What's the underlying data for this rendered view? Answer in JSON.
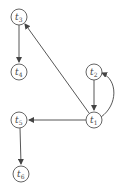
{
  "diagram": {
    "type": "directed-graph",
    "nodes": [
      {
        "id": "t1",
        "label": "t",
        "sub": "1",
        "x": 94,
        "y": 120
      },
      {
        "id": "t2",
        "label": "t",
        "sub": "2",
        "x": 94,
        "y": 72
      },
      {
        "id": "t3",
        "label": "t",
        "sub": "3",
        "x": 19,
        "y": 17
      },
      {
        "id": "t4",
        "label": "t",
        "sub": "4",
        "x": 19,
        "y": 72
      },
      {
        "id": "t5",
        "label": "t",
        "sub": "5",
        "x": 19,
        "y": 120
      },
      {
        "id": "t6",
        "label": "t",
        "sub": "6",
        "x": 21,
        "y": 174
      }
    ],
    "edges": [
      {
        "from": "t3",
        "to": "t4"
      },
      {
        "from": "t1",
        "to": "t3"
      },
      {
        "from": "t2",
        "to": "t1"
      },
      {
        "from": "t1",
        "to": "t2",
        "curved": true
      },
      {
        "from": "t1",
        "to": "t5"
      },
      {
        "from": "t5",
        "to": "t6"
      }
    ],
    "colors": {
      "stroke": "#444444",
      "node_fill": "#ffffff"
    }
  }
}
